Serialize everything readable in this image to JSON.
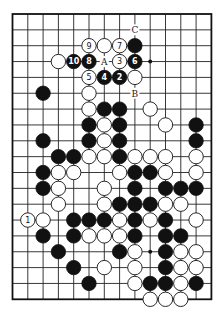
{
  "diagram": {
    "board": {
      "cols": 14,
      "rows": 19,
      "origin_x": 12.5,
      "origin_y": 14,
      "spacing_x": 15.3,
      "spacing_y": 15.85,
      "edges": {
        "top": true,
        "left": true,
        "right": true,
        "bottom": true
      },
      "stone_radius": 7.2,
      "colors": {
        "black": "#111111",
        "white": "#ffffff",
        "line": "#222222"
      }
    },
    "stones": [
      {
        "c": 5,
        "r": 2,
        "color": "W",
        "label": "9"
      },
      {
        "c": 6,
        "r": 2,
        "color": "W"
      },
      {
        "c": 7,
        "r": 2,
        "color": "W",
        "label": "7"
      },
      {
        "c": 8,
        "r": 2,
        "color": "B"
      },
      {
        "c": 3,
        "r": 3,
        "color": "W"
      },
      {
        "c": 4,
        "r": 3,
        "color": "B",
        "label": "10"
      },
      {
        "c": 5,
        "r": 3,
        "color": "B",
        "label": "8"
      },
      {
        "c": 7,
        "r": 3,
        "color": "W",
        "label": "3"
      },
      {
        "c": 8,
        "r": 3,
        "color": "B",
        "label": "6"
      },
      {
        "c": 5,
        "r": 4,
        "color": "W",
        "label": "5"
      },
      {
        "c": 6,
        "r": 4,
        "color": "B",
        "label": "4"
      },
      {
        "c": 7,
        "r": 4,
        "color": "B",
        "label": "2"
      },
      {
        "c": 8,
        "r": 4,
        "color": "W"
      },
      {
        "c": 2,
        "r": 5,
        "color": "B"
      },
      {
        "c": 5,
        "r": 5,
        "color": "W"
      },
      {
        "c": 5,
        "r": 6,
        "color": "W"
      },
      {
        "c": 6,
        "r": 6,
        "color": "B"
      },
      {
        "c": 7,
        "r": 6,
        "color": "B"
      },
      {
        "c": 9,
        "r": 6,
        "color": "W"
      },
      {
        "c": 5,
        "r": 7,
        "color": "B"
      },
      {
        "c": 6,
        "r": 7,
        "color": "W"
      },
      {
        "c": 7,
        "r": 7,
        "color": "B"
      },
      {
        "c": 10,
        "r": 7,
        "color": "W"
      },
      {
        "c": 12,
        "r": 7,
        "color": "B"
      },
      {
        "c": 2,
        "r": 8,
        "color": "B"
      },
      {
        "c": 5,
        "r": 8,
        "color": "B"
      },
      {
        "c": 6,
        "r": 8,
        "color": "W"
      },
      {
        "c": 7,
        "r": 8,
        "color": "B"
      },
      {
        "c": 12,
        "r": 8,
        "color": "B"
      },
      {
        "c": 3,
        "r": 9,
        "color": "B"
      },
      {
        "c": 4,
        "r": 9,
        "color": "B"
      },
      {
        "c": 5,
        "r": 9,
        "color": "W"
      },
      {
        "c": 6,
        "r": 9,
        "color": "W"
      },
      {
        "c": 7,
        "r": 9,
        "color": "B"
      },
      {
        "c": 8,
        "r": 9,
        "color": "W"
      },
      {
        "c": 9,
        "r": 9,
        "color": "W"
      },
      {
        "c": 10,
        "r": 9,
        "color": "W"
      },
      {
        "c": 12,
        "r": 9,
        "color": "W"
      },
      {
        "c": 2,
        "r": 10,
        "color": "B"
      },
      {
        "c": 3,
        "r": 10,
        "color": "W"
      },
      {
        "c": 4,
        "r": 10,
        "color": "W"
      },
      {
        "c": 7,
        "r": 10,
        "color": "W"
      },
      {
        "c": 8,
        "r": 10,
        "color": "B"
      },
      {
        "c": 9,
        "r": 10,
        "color": "B"
      },
      {
        "c": 10,
        "r": 10,
        "color": "W"
      },
      {
        "c": 12,
        "r": 10,
        "color": "W"
      },
      {
        "c": 2,
        "r": 11,
        "color": "B"
      },
      {
        "c": 3,
        "r": 11,
        "color": "W"
      },
      {
        "c": 6,
        "r": 11,
        "color": "W"
      },
      {
        "c": 8,
        "r": 11,
        "color": "B"
      },
      {
        "c": 10,
        "r": 11,
        "color": "B"
      },
      {
        "c": 11,
        "r": 11,
        "color": "B"
      },
      {
        "c": 12,
        "r": 11,
        "color": "B"
      },
      {
        "c": 3,
        "r": 12,
        "color": "W"
      },
      {
        "c": 6,
        "r": 12,
        "color": "W"
      },
      {
        "c": 7,
        "r": 12,
        "color": "B"
      },
      {
        "c": 8,
        "r": 12,
        "color": "B"
      },
      {
        "c": 9,
        "r": 12,
        "color": "B"
      },
      {
        "c": 10,
        "r": 12,
        "color": "W"
      },
      {
        "c": 11,
        "r": 12,
        "color": "W"
      },
      {
        "c": 1,
        "r": 13,
        "color": "W",
        "label": "1"
      },
      {
        "c": 2,
        "r": 13,
        "color": "W"
      },
      {
        "c": 4,
        "r": 13,
        "color": "B"
      },
      {
        "c": 5,
        "r": 13,
        "color": "B"
      },
      {
        "c": 6,
        "r": 13,
        "color": "B"
      },
      {
        "c": 7,
        "r": 13,
        "color": "W"
      },
      {
        "c": 8,
        "r": 13,
        "color": "B"
      },
      {
        "c": 9,
        "r": 13,
        "color": "W"
      },
      {
        "c": 10,
        "r": 13,
        "color": "B"
      },
      {
        "c": 12,
        "r": 13,
        "color": "W"
      },
      {
        "c": 2,
        "r": 14,
        "color": "B"
      },
      {
        "c": 4,
        "r": 14,
        "color": "B"
      },
      {
        "c": 5,
        "r": 14,
        "color": "W"
      },
      {
        "c": 6,
        "r": 14,
        "color": "W"
      },
      {
        "c": 7,
        "r": 14,
        "color": "W"
      },
      {
        "c": 8,
        "r": 14,
        "color": "B"
      },
      {
        "c": 10,
        "r": 14,
        "color": "B"
      },
      {
        "c": 11,
        "r": 14,
        "color": "B"
      },
      {
        "c": 3,
        "r": 15,
        "color": "B"
      },
      {
        "c": 7,
        "r": 15,
        "color": "B"
      },
      {
        "c": 8,
        "r": 15,
        "color": "W"
      },
      {
        "c": 10,
        "r": 15,
        "color": "B"
      },
      {
        "c": 11,
        "r": 15,
        "color": "W"
      },
      {
        "c": 12,
        "r": 15,
        "color": "W"
      },
      {
        "c": 4,
        "r": 16,
        "color": "B"
      },
      {
        "c": 6,
        "r": 16,
        "color": "W"
      },
      {
        "c": 8,
        "r": 16,
        "color": "W"
      },
      {
        "c": 10,
        "r": 16,
        "color": "B"
      },
      {
        "c": 11,
        "r": 16,
        "color": "W"
      },
      {
        "c": 12,
        "r": 16,
        "color": "W"
      },
      {
        "c": 5,
        "r": 17,
        "color": "B"
      },
      {
        "c": 8,
        "r": 17,
        "color": "W"
      },
      {
        "c": 9,
        "r": 17,
        "color": "B"
      },
      {
        "c": 10,
        "r": 17,
        "color": "B"
      },
      {
        "c": 11,
        "r": 17,
        "color": "W"
      },
      {
        "c": 12,
        "r": 17,
        "color": "B"
      },
      {
        "c": 9,
        "r": 18,
        "color": "W"
      },
      {
        "c": 10,
        "r": 18,
        "color": "W"
      },
      {
        "c": 11,
        "r": 18,
        "color": "W"
      }
    ],
    "letters": [
      {
        "c": 8,
        "r": 1,
        "text": "C"
      },
      {
        "c": 6,
        "r": 3,
        "text": "A"
      },
      {
        "c": 8,
        "r": 5,
        "text": "B"
      }
    ],
    "dots": [
      {
        "c": 9,
        "r": 3
      },
      {
        "c": 9,
        "r": 15
      }
    ]
  }
}
